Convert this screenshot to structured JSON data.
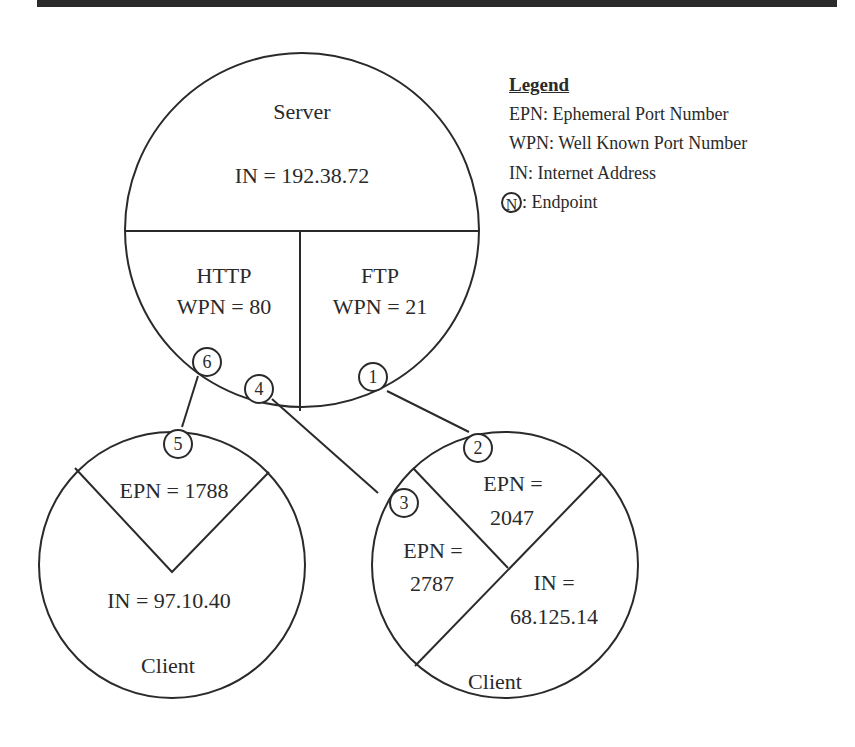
{
  "header_bar": {
    "color": "#2b2b2b"
  },
  "legend": {
    "title": "Legend",
    "items": [
      {
        "label": "EPN: Ephemeral Port Number"
      },
      {
        "label": "WPN: Well Known Port Number"
      },
      {
        "label": "IN: Internet Address"
      },
      {
        "badge": "N",
        "label": ": Endpoint"
      }
    ]
  },
  "server": {
    "title": "Server",
    "address": "IN = 192.38.72",
    "ports": [
      {
        "protocol": "HTTP",
        "port": "WPN = 80"
      },
      {
        "protocol": "FTP",
        "port": "WPN = 21"
      }
    ]
  },
  "client_left": {
    "port": "EPN = 1788",
    "address": "IN = 97.10.40",
    "label": "Client"
  },
  "client_right": {
    "ports": [
      {
        "line1": "EPN =",
        "line2": "2047"
      },
      {
        "line1": "EPN =",
        "line2": "2787"
      }
    ],
    "address_line1": "IN =",
    "address_line2": "68.125.14",
    "label": "Client"
  },
  "endpoints": [
    "1",
    "2",
    "3",
    "4",
    "5",
    "6"
  ],
  "connections": [
    {
      "from": "1",
      "to": "2"
    },
    {
      "from": "4",
      "to": "3"
    },
    {
      "from": "6",
      "to": "5"
    }
  ]
}
